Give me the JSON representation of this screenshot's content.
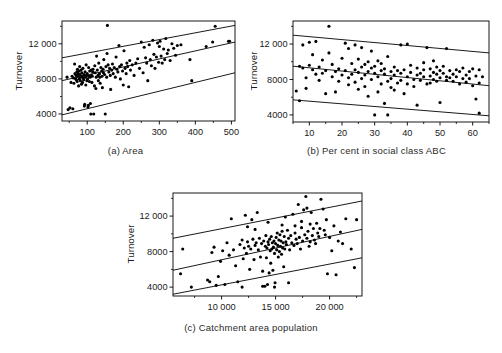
{
  "figure": {
    "kind": "scatter-plot-panel-figure",
    "panel_count": 3,
    "line_color": "#000000",
    "point_color": "#000000",
    "frame_color": "#000000"
  },
  "chart_data": [
    {
      "type": "scatter",
      "panel": "a",
      "title": "",
      "caption": "(a) Area",
      "xlabel": "Area",
      "ylabel": "Turnover",
      "xlim": [
        30,
        510
      ],
      "ylim": [
        3200,
        14600
      ],
      "xticks": [
        100,
        200,
        300,
        400,
        500
      ],
      "xtick_labels": [
        "100",
        "200",
        "300",
        "400",
        "500"
      ],
      "yticks": [
        4000,
        8000,
        12000
      ],
      "ytick_labels": [
        "4000",
        "8000",
        "12 000"
      ],
      "grid": false,
      "legend": "none",
      "lines": [
        {
          "name": "upper bound",
          "x": [
            30,
            510
          ],
          "y": [
            10400,
            14100
          ]
        },
        {
          "name": "fitted regression",
          "x": [
            30,
            510
          ],
          "y": [
            7800,
            12200
          ]
        },
        {
          "name": "lower bound",
          "x": [
            30,
            510
          ],
          "y": [
            3900,
            8700
          ]
        }
      ],
      "x": [
        44,
        47,
        52,
        55,
        58,
        60,
        62,
        63,
        65,
        66,
        68,
        69,
        70,
        71,
        72,
        73,
        74,
        75,
        76,
        77,
        78,
        79,
        80,
        81,
        82,
        83,
        84,
        85,
        86,
        87,
        88,
        89,
        90,
        91,
        92,
        93,
        94,
        95,
        96,
        97,
        98,
        99,
        100,
        101,
        102,
        103,
        104,
        105,
        106,
        107,
        108,
        109,
        110,
        111,
        112,
        113,
        114,
        115,
        116,
        118,
        120,
        121,
        122,
        124,
        125,
        126,
        128,
        130,
        131,
        132,
        134,
        135,
        136,
        138,
        140,
        141,
        142,
        144,
        145,
        146,
        148,
        150,
        152,
        154,
        155,
        156,
        158,
        160,
        162,
        164,
        165,
        168,
        170,
        172,
        175,
        178,
        180,
        182,
        185,
        188,
        190,
        192,
        195,
        198,
        200,
        202,
        205,
        208,
        210,
        212,
        215,
        218,
        220,
        225,
        230,
        235,
        240,
        245,
        250,
        255,
        258,
        262,
        265,
        268,
        272,
        275,
        278,
        282,
        285,
        288,
        292,
        295,
        298,
        300,
        302,
        305,
        308,
        312,
        315,
        318,
        322,
        325,
        330,
        335,
        340,
        345,
        350,
        360,
        385,
        390,
        430,
        448,
        455,
        492,
        495
      ],
      "y": [
        8200,
        4500,
        4700,
        7600,
        8300,
        4600,
        8100,
        7500,
        9700,
        8600,
        8000,
        8400,
        7900,
        8800,
        7700,
        9100,
        8300,
        8600,
        7200,
        8900,
        8000,
        9400,
        8500,
        7800,
        8200,
        9000,
        7400,
        8700,
        8300,
        7600,
        9200,
        8100,
        7900,
        8500,
        4900,
        5100,
        8800,
        8200,
        7300,
        9600,
        8400,
        7800,
        8600,
        8000,
        4800,
        5000,
        9300,
        8300,
        7700,
        8900,
        8200,
        5200,
        4000,
        9000,
        8400,
        7600,
        8300,
        8800,
        9100,
        4000,
        7200,
        9500,
        8700,
        6900,
        8200,
        10600,
        9000,
        8400,
        7800,
        9800,
        8600,
        8200,
        7500,
        9300,
        8900,
        8300,
        7000,
        9100,
        8700,
        10200,
        8500,
        4000,
        9400,
        8200,
        10900,
        14100,
        9600,
        8800,
        9200,
        8400,
        6800,
        9000,
        9700,
        8600,
        9300,
        8200,
        10500,
        9100,
        8800,
        11800,
        9400,
        8000,
        9600,
        8900,
        7300,
        11200,
        9200,
        8600,
        9800,
        9400,
        7100,
        10100,
        9000,
        9600,
        8400,
        9800,
        10300,
        9200,
        12200,
        8700,
        11600,
        10400,
        9800,
        7800,
        11900,
        10200,
        9500,
        12400,
        10800,
        9200,
        10500,
        12100,
        9900,
        11700,
        12300,
        10600,
        9800,
        11400,
        10200,
        12600,
        10900,
        11300,
        10100,
        12000,
        11500,
        10700,
        11800,
        11900,
        10200,
        7800,
        11700,
        12200,
        14000,
        12300,
        12300,
        12400
      ]
    },
    {
      "type": "scatter",
      "panel": "b",
      "title": "",
      "caption": "(b) Per cent in social class ABC",
      "xlabel": "Per cent in social class ABC",
      "ylabel": "Turnover",
      "xlim": [
        5,
        65
      ],
      "ylim": [
        3200,
        14600
      ],
      "xticks": [
        10,
        20,
        30,
        40,
        50,
        60
      ],
      "xtick_labels": [
        "10",
        "20",
        "30",
        "40",
        "50",
        "60"
      ],
      "yticks": [
        4000,
        8000,
        12000
      ],
      "ytick_labels": [
        "4000",
        "8000",
        "12 000"
      ],
      "grid": false,
      "legend": "none",
      "lines": [
        {
          "name": "upper bound",
          "x": [
            5,
            65
          ],
          "y": [
            13000,
            11000
          ]
        },
        {
          "name": "fitted regression",
          "x": [
            5,
            65
          ],
          "y": [
            9500,
            7300
          ]
        },
        {
          "name": "lower bound",
          "x": [
            5,
            65
          ],
          "y": [
            5700,
            3900
          ]
        }
      ],
      "x": [
        6,
        7,
        7,
        8,
        8,
        9,
        9,
        10,
        10,
        11,
        11,
        12,
        12,
        13,
        13,
        14,
        14,
        15,
        15,
        16,
        16,
        17,
        17,
        18,
        18,
        19,
        19,
        20,
        20,
        21,
        21,
        22,
        22,
        22,
        23,
        23,
        24,
        24,
        24,
        25,
        25,
        25,
        26,
        26,
        26,
        27,
        27,
        27,
        28,
        28,
        28,
        29,
        29,
        29,
        30,
        30,
        30,
        31,
        31,
        31,
        32,
        32,
        32,
        33,
        33,
        33,
        34,
        34,
        34,
        35,
        35,
        35,
        36,
        36,
        36,
        37,
        37,
        38,
        38,
        38,
        39,
        39,
        40,
        40,
        40,
        41,
        41,
        42,
        42,
        43,
        43,
        43,
        44,
        44,
        45,
        45,
        45,
        46,
        46,
        47,
        47,
        47,
        48,
        48,
        48,
        49,
        49,
        49,
        50,
        50,
        50,
        51,
        51,
        52,
        52,
        52,
        53,
        53,
        54,
        54,
        55,
        55,
        56,
        56,
        57,
        57,
        58,
        58,
        59,
        59,
        60,
        60,
        61,
        61,
        62,
        62,
        62,
        63,
        63,
        63,
        64,
        64
      ],
      "y": [
        6700,
        5600,
        9500,
        9300,
        11900,
        8200,
        7000,
        9600,
        12200,
        10800,
        9100,
        12300,
        8600,
        7900,
        9400,
        10200,
        8700,
        6400,
        9000,
        14000,
        11000,
        8300,
        9700,
        6600,
        8900,
        9200,
        7800,
        10400,
        8500,
        12100,
        9000,
        8200,
        11500,
        7400,
        9800,
        8600,
        11900,
        9100,
        7700,
        10300,
        8800,
        6900,
        9400,
        8100,
        11600,
        9700,
        8500,
        7200,
        10000,
        8900,
        6100,
        9300,
        8000,
        11200,
        9500,
        8700,
        4000,
        10100,
        8300,
        6600,
        9800,
        9000,
        7500,
        8600,
        5300,
        9200,
        7800,
        4000,
        10600,
        8900,
        8100,
        7100,
        9400,
        8500,
        6800,
        9000,
        7600,
        8700,
        7900,
        11900,
        9100,
        6400,
        8300,
        7500,
        12000,
        9600,
        8800,
        8000,
        7200,
        9300,
        8500,
        5100,
        8700,
        7900,
        9900,
        9100,
        8300,
        7500,
        11600,
        9200,
        8400,
        7600,
        10100,
        8800,
        8000,
        9400,
        8600,
        7800,
        9000,
        8200,
        5400,
        9500,
        8700,
        8300,
        7900,
        11500,
        9000,
        8200,
        8600,
        7800,
        9100,
        8300,
        7500,
        8900,
        8100,
        9300,
        8500,
        7700,
        8900,
        8100,
        9200,
        7300,
        5800,
        8400,
        7600,
        4200,
        9100,
        8300
      ]
    },
    {
      "type": "scatter",
      "panel": "c",
      "title": "",
      "caption": "(c) Catchment area population",
      "xlabel": "Catchment area population",
      "ylabel": "Turnover",
      "xlim": [
        5500,
        23000
      ],
      "ylim": [
        3000,
        14600
      ],
      "xticks": [
        10000,
        15000,
        20000
      ],
      "xtick_labels": [
        "10 000",
        "15 000",
        "20 000"
      ],
      "yticks": [
        4000,
        8000,
        12000
      ],
      "ytick_labels": [
        "4000",
        "8000",
        "12 000"
      ],
      "grid": false,
      "legend": "none",
      "lines": [
        {
          "name": "upper bound",
          "x": [
            5500,
            23000
          ],
          "y": [
            9500,
            13700
          ]
        },
        {
          "name": "fitted regression",
          "x": [
            5500,
            23000
          ],
          "y": [
            5900,
            10500
          ]
        },
        {
          "name": "lower bound",
          "x": [
            5500,
            23000
          ],
          "y": [
            3200,
            7300
          ]
        }
      ],
      "x": [
        6200,
        6400,
        7200,
        8700,
        8900,
        9100,
        9300,
        9500,
        9700,
        9900,
        10100,
        10300,
        10500,
        10700,
        10900,
        11100,
        11300,
        11500,
        11700,
        11900,
        12000,
        12100,
        12200,
        12300,
        12400,
        12500,
        12600,
        12700,
        12800,
        12900,
        13000,
        13100,
        13200,
        13300,
        13400,
        13500,
        13600,
        13700,
        13800,
        13900,
        14000,
        14050,
        14100,
        14150,
        14200,
        14250,
        14300,
        14350,
        14400,
        14450,
        14500,
        14550,
        14600,
        14650,
        14700,
        14750,
        14800,
        14850,
        14900,
        14950,
        15000,
        15050,
        15100,
        15150,
        15200,
        15250,
        15300,
        15350,
        15400,
        15450,
        15500,
        15550,
        15600,
        15650,
        15700,
        15750,
        15800,
        15850,
        15900,
        15950,
        16000,
        16100,
        16200,
        16300,
        16400,
        16500,
        16600,
        16700,
        16800,
        16900,
        17000,
        17100,
        17200,
        17300,
        17400,
        17500,
        17600,
        17700,
        17800,
        17900,
        18000,
        18100,
        18200,
        18300,
        18400,
        18500,
        18600,
        18700,
        18800,
        18900,
        19000,
        19200,
        19400,
        19500,
        19600,
        19700,
        19800,
        20000,
        20200,
        20400,
        20600,
        20800,
        21000,
        21200,
        21500,
        22000,
        22300,
        22500,
        12400,
        13100,
        14300,
        15600,
        16800,
        17400,
        18200,
        19100,
        13800,
        14900,
        16200,
        11900,
        17900
      ],
      "y": [
        5500,
        8300,
        4000,
        4800,
        4600,
        7900,
        8500,
        4200,
        5200,
        6900,
        8100,
        4300,
        9000,
        7600,
        11700,
        8200,
        6400,
        4600,
        8800,
        9300,
        7200,
        8400,
        12100,
        7800,
        9100,
        8600,
        6000,
        8300,
        11600,
        9400,
        7100,
        8700,
        9000,
        12400,
        8200,
        9500,
        7400,
        8900,
        5800,
        9200,
        4100,
        8600,
        9800,
        7300,
        8400,
        4300,
        9100,
        8800,
        5600,
        9400,
        8100,
        6700,
        9700,
        8300,
        9000,
        5900,
        8500,
        9200,
        7800,
        4500,
        8900,
        9600,
        8200,
        10100,
        8700,
        7400,
        9300,
        8000,
        9900,
        8600,
        9200,
        7700,
        10300,
        8400,
        9000,
        6300,
        9700,
        8300,
        11900,
        9100,
        8800,
        10400,
        9500,
        8200,
        9800,
        9000,
        12200,
        8700,
        10100,
        9400,
        8900,
        13300,
        9600,
        8300,
        10700,
        9200,
        12700,
        9900,
        14200,
        9500,
        10300,
        8600,
        9100,
        12400,
        9800,
        10600,
        9300,
        8900,
        11200,
        10100,
        9700,
        13900,
        12800,
        10400,
        9900,
        11600,
        5500,
        9600,
        8100,
        10900,
        5400,
        9200,
        10200,
        8900,
        11700,
        8300,
        6200,
        11600,
        10800,
        10500,
        11300,
        11000,
        10900,
        11400,
        11100,
        10600,
        4100,
        4000,
        4500,
        4000,
        12900
      ]
    }
  ]
}
